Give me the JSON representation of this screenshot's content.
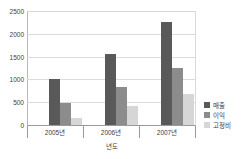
{
  "chart_data": {
    "type": "bar",
    "title": "",
    "subtitle": "",
    "xlabel": "년도",
    "ylabel": "",
    "categories": [
      "2005년",
      "2006년",
      "2007년"
    ],
    "series": [
      {
        "name": "매출",
        "color": "#595959",
        "values": [
          1000,
          1550,
          2270
        ]
      },
      {
        "name": "이익",
        "color": "#8c8c8c",
        "values": [
          490,
          830,
          1240
        ]
      },
      {
        "name": "고정비",
        "color": "#d6d6d6",
        "values": [
          145,
          420,
          680
        ]
      }
    ],
    "ylim": [
      0,
      2500
    ],
    "yticks": [
      0,
      500,
      1000,
      1500,
      2000,
      2500
    ],
    "ytick_labels": [
      "0",
      "500",
      "1000",
      "1500",
      "2000",
      "2500"
    ],
    "grid": true,
    "legend_position": "right"
  },
  "axis": {
    "y_labels": [
      "2500",
      "2000",
      "1500",
      "1000",
      "500",
      "0"
    ],
    "x_labels": [
      "2005년",
      "2006년",
      "2007년"
    ],
    "x_title": "년도"
  },
  "legend": {
    "items": [
      {
        "label": "매출"
      },
      {
        "label": "이익"
      },
      {
        "label": "고정비"
      }
    ]
  }
}
